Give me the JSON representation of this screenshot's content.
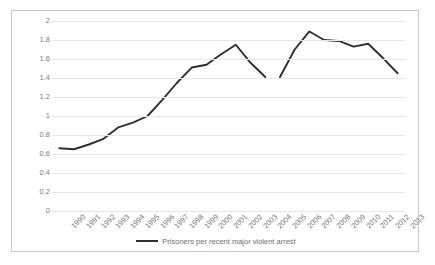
{
  "chart_data": {
    "type": "line",
    "title": "",
    "xlabel": "",
    "ylabel": "",
    "grid": true,
    "legend_position": "bottom",
    "ylim": [
      0,
      2
    ],
    "ytick_labels": [
      "2",
      "1.8",
      "1.6",
      "1.4",
      "1.2",
      "1",
      "0.8",
      "0.6",
      "0.4",
      "0.2",
      "0"
    ],
    "ytick_values": [
      2,
      1.8,
      1.6,
      1.4,
      1.2,
      1,
      0.8,
      0.6,
      0.4,
      0.2,
      0
    ],
    "categories": [
      "1990",
      "1991",
      "1992",
      "1993",
      "1994",
      "1995",
      "1996",
      "1997",
      "1998",
      "1999",
      "2000",
      "2001",
      "2002",
      "2003",
      "2004",
      "2005",
      "2006",
      "2007",
      "2008",
      "2009",
      "2010",
      "2011",
      "2012",
      "2013"
    ],
    "series": [
      {
        "name": "Prisoners per recent major violent arrest",
        "color": "#2f2f2f",
        "values": [
          0.66,
          0.65,
          0.7,
          0.76,
          0.88,
          0.93,
          1.0,
          1.17,
          1.35,
          1.51,
          1.54,
          1.65,
          1.75,
          1.56,
          1.41,
          1.41,
          1.7,
          1.89,
          1.8,
          1.79,
          1.73,
          1.76,
          1.61,
          1.45
        ],
        "segments": [
          {
            "start_index": 0,
            "end_index": 8
          },
          {
            "start_index": 8,
            "end_index": 14
          },
          {
            "start_index": 15,
            "end_index": 23
          }
        ]
      }
    ],
    "breaks": [
      {
        "between": [
          "1998",
          "1998"
        ],
        "note": "marker gap at 1998"
      },
      {
        "between": [
          "2004",
          "2005"
        ],
        "note": "series discontinuity"
      }
    ]
  },
  "legend": {
    "entries": [
      {
        "label": "Prisoners per recent major violent arrest",
        "color": "#2f2f2f"
      }
    ]
  },
  "colors": {
    "series_line": "#2f2f2f",
    "gridline": "#e6e6e6",
    "axis_text": "#7b7b7b",
    "frame_border": "#c9c9c9",
    "background": "#ffffff"
  }
}
